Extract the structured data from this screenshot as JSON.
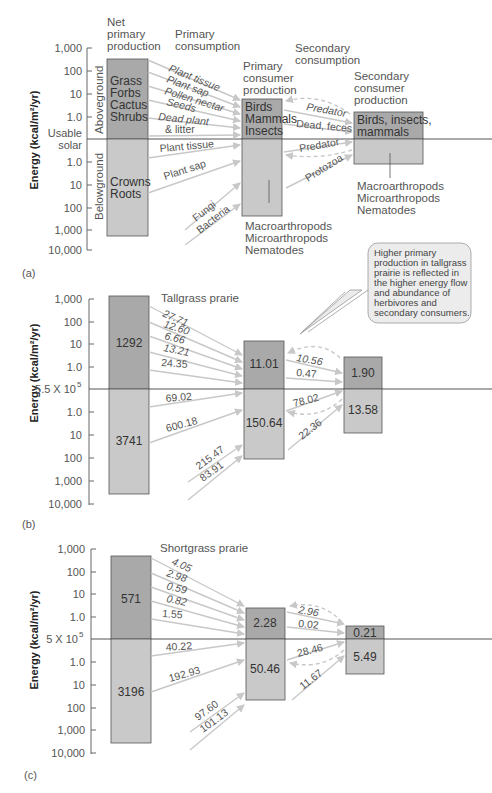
{
  "figure": {
    "panels": [
      {
        "id": "a",
        "label": "(a)",
        "y_axis_label": "Energy (kcal/m²/yr)",
        "y_ticks_above": [
          "1,000",
          "100",
          "10",
          "1.0"
        ],
        "baseline_label_1": "Usable",
        "baseline_label_2": "solar",
        "y_ticks_below": [
          "1.0",
          "10",
          "100",
          "1,000",
          "10,000"
        ],
        "headers": {
          "net_primary": [
            "Net",
            "primary",
            "production"
          ],
          "primary_consumption": [
            "Primary",
            "consumption"
          ],
          "primary_consumer_production": [
            "Primary",
            "consumer",
            "production"
          ],
          "secondary_consumption": [
            "Secondary",
            "consumption"
          ],
          "secondary_consumer_production": [
            "Secondary",
            "consumer",
            "production"
          ]
        },
        "aboveground_label": "Aboveground",
        "belowground_label": "Belowground",
        "producer_above": [
          "Grass",
          "Forbs",
          "Cactus",
          "Shrubs"
        ],
        "producer_below": [
          "Crowns",
          "Roots"
        ],
        "primary_consumer_above": [
          "Birds",
          "Mammals",
          "Insects"
        ],
        "secondary_consumer_above": [
          "Birds, insects,",
          "mammals"
        ],
        "flows_above": [
          "Plant tissue",
          "Plant sap",
          "Pollen nectar",
          "Seeds",
          "Dead plant",
          "& litter"
        ],
        "flows_below": [
          "Plant tissue",
          "Plant sap",
          "Fungi",
          "Bacteria"
        ],
        "secondary_flows_above": [
          "Predator",
          "Dead, feces"
        ],
        "secondary_flows_below": [
          "Predator",
          "Protozoa"
        ],
        "primary_consumer_below": [
          "Macroarthropods",
          "Microarthropods",
          "Nematodes"
        ],
        "secondary_consumer_below": [
          "Macroarthropods",
          "Microarthropods",
          "Nematodes"
        ]
      },
      {
        "id": "b",
        "label": "(b)",
        "title": "Tallgrass prarie",
        "y_axis_label": "Energy (kcal/m²/yr)",
        "y_ticks_above": [
          "1,000",
          "100",
          "10",
          "1.0"
        ],
        "baseline_label": "5.5 X 10",
        "baseline_exp": "5",
        "y_ticks_below": [
          "1.0",
          "10",
          "100",
          "1,000",
          "10,000"
        ],
        "producer_above": "1292",
        "producer_below": "3741",
        "primary_above": "11.01",
        "primary_below": "150.64",
        "secondary_above": "1.90",
        "secondary_below": "13.58",
        "flows_above": [
          "27.71",
          "12.60",
          "6.66",
          "13.21",
          "24.35"
        ],
        "flows_below": [
          "69.02",
          "600.18",
          "215.47",
          "83.91"
        ],
        "secondary_flows": [
          "10.56",
          "0.47",
          "78.02",
          "22.36"
        ]
      },
      {
        "id": "c",
        "label": "(c)",
        "title": "Shortgrass prarie",
        "y_axis_label": "Energy (kcal/m²/yr)",
        "y_ticks_above": [
          "1,000",
          "100",
          "10",
          "1.0"
        ],
        "baseline_label": "5 X 10",
        "baseline_exp": "5",
        "y_ticks_below": [
          "1.0",
          "10",
          "100",
          "1,000",
          "10,000"
        ],
        "producer_above": "571",
        "producer_below": "3196",
        "primary_above": "2.28",
        "primary_below": "50.46",
        "secondary_above": "0.21",
        "secondary_below": "5.49",
        "flows_above": [
          "4.05",
          "2.98",
          "0.59",
          "0.82",
          "1.55"
        ],
        "flows_below": [
          "40.22",
          "192.93",
          "97.60",
          "101.13"
        ],
        "secondary_flows": [
          "2.96",
          "0.02",
          "28.46",
          "11.67"
        ]
      }
    ],
    "callout": [
      "Higher primary",
      "production in tallgrass",
      "prairie is reflected in",
      "the higher energy flow",
      "and abundance of",
      "herbivores and",
      "secondary consumers."
    ],
    "colors": {
      "above_box": "#a9a9a9",
      "below_box": "#c9c9c9",
      "box_border": "#555555",
      "arrow": "#c8c8c8",
      "callout_fill": "#ececec"
    }
  }
}
